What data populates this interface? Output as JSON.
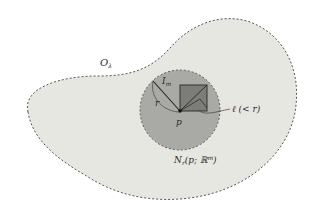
{
  "diagram": {
    "colors": {
      "background": "#ffffff",
      "outer_fill": "#e6e7e1",
      "outer_stroke": "#555555",
      "ball_fill": "#a9aaa5",
      "square_fill": "#7c7d79",
      "square_stroke": "#333333",
      "line": "#222222"
    },
    "labels": {
      "open_set": "O",
      "open_set_sub": "λ",
      "cube": "I",
      "cube_sub": "m",
      "radius": "r",
      "point": "p",
      "side_length": "ℓ (< r)",
      "neighborhood_main": "N",
      "neighborhood_sub": "r",
      "neighborhood_args": "(p; ℝ",
      "neighborhood_sup": "m",
      "neighborhood_close": ")"
    }
  }
}
